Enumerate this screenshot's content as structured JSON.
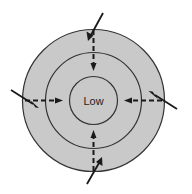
{
  "diagram": {
    "center_label": "Low",
    "colors": {
      "fill": "#c9c9c9",
      "outline": "#333333",
      "arrows": "#1a1a1a",
      "background": "#ffffff"
    },
    "rings": [
      {
        "name": "outer",
        "cx": 93.5,
        "cy": 100.5,
        "r": 71
      },
      {
        "name": "middle",
        "cx": 93.5,
        "cy": 100.5,
        "r": 48
      },
      {
        "name": "inner",
        "cx": 93.5,
        "cy": 100.5,
        "r": 24
      }
    ],
    "inflow_arrows": [
      {
        "side": "top",
        "direction": "down"
      },
      {
        "side": "bottom",
        "direction": "up"
      },
      {
        "side": "left",
        "direction": "right"
      },
      {
        "side": "right",
        "direction": "left"
      }
    ],
    "deflected_wind_arrows": [
      {
        "side": "top",
        "direction": "down-left"
      },
      {
        "side": "bottom",
        "direction": "up-right"
      },
      {
        "side": "left",
        "direction": "down-right"
      },
      {
        "side": "right",
        "direction": "up-left"
      }
    ]
  }
}
